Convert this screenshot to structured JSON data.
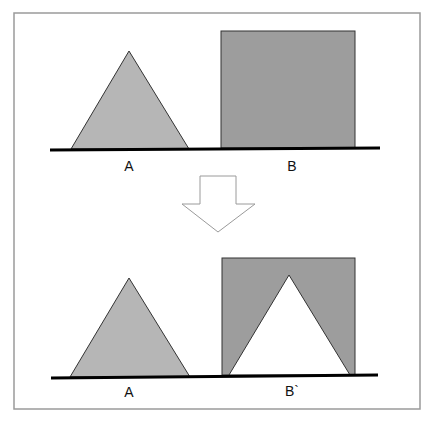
{
  "diagram": {
    "title": "",
    "frame": {
      "x": 14,
      "y": 13,
      "width": 406,
      "height": 396,
      "stroke": "#9a9a9a"
    },
    "colors": {
      "triangle_fill": "#b6b6b6",
      "square_fill": "#9d9d9d",
      "outline": "#333333",
      "baseline": "#000000",
      "cutout_fill": "#ffffff",
      "arrow_stroke": "#9a9a9a",
      "arrow_fill": "#ffffff"
    },
    "top_row": {
      "shape_a": {
        "type": "triangle",
        "label": "A",
        "apex": [
          129,
          51
        ],
        "base_left": [
          71,
          149
        ],
        "base_right": [
          189,
          149
        ]
      },
      "shape_b": {
        "type": "square",
        "label": "B",
        "x": 221,
        "y": 31,
        "width": 134,
        "height": 117
      },
      "baseline": {
        "x1": 50,
        "y1": 150,
        "x2": 380,
        "y2": 148
      },
      "label_a_pos": [
        129,
        171
      ],
      "label_b_pos": [
        292,
        171
      ]
    },
    "arrow": {
      "direction": "down",
      "points": "200,176 236,176 236,204 255,204 218,232 182,204 200,204"
    },
    "bottom_row": {
      "shape_a": {
        "type": "triangle",
        "label": "A",
        "apex": [
          129,
          278
        ],
        "base_left": [
          70,
          377
        ],
        "base_right": [
          190,
          377
        ]
      },
      "shape_b_prime": {
        "type": "square-with-triangular-cutout",
        "label": "B`",
        "x": 222,
        "y": 258,
        "width": 133,
        "height": 117,
        "cutout": {
          "apex": [
            289,
            275
          ],
          "base_left": [
            229,
            375
          ],
          "base_right": [
            350,
            375
          ]
        }
      },
      "baseline": {
        "x1": 51,
        "y1": 378,
        "x2": 378,
        "y2": 375
      },
      "label_a_pos": [
        129,
        397
      ],
      "label_b_pos": [
        292,
        396
      ]
    }
  }
}
